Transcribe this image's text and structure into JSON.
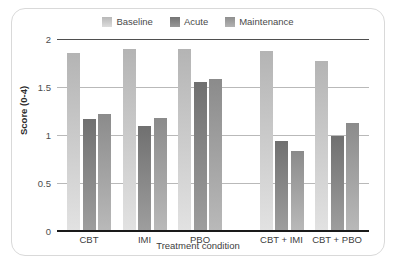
{
  "chart_data": {
    "type": "bar",
    "title": "",
    "xlabel": "Treatment condition",
    "ylabel": "Score (0-4)",
    "ylim": [
      0,
      2
    ],
    "yticks": [
      "0",
      "0.5",
      "1",
      "1.5",
      "2"
    ],
    "ytick_values": [
      0,
      0.5,
      1,
      1.5,
      2
    ],
    "grid": true,
    "legend_position": "top-center",
    "categories": [
      "CBT",
      "IMI",
      "PBO",
      "CBT + IMI",
      "CBT + PBO"
    ],
    "series": [
      {
        "name": "Baseline",
        "color": "#d2d2d2",
        "values": [
          1.85,
          1.9,
          1.9,
          1.88,
          1.77
        ]
      },
      {
        "name": "Acute",
        "color": "#8e8e8e",
        "values": [
          1.17,
          1.09,
          1.55,
          0.94,
          0.99
        ]
      },
      {
        "name": "Maintenance",
        "color": "#a9a9a9",
        "values": [
          1.22,
          1.18,
          1.58,
          0.83,
          1.13
        ]
      }
    ]
  },
  "legend": {
    "entries": [
      {
        "label": "Baseline"
      },
      {
        "label": "Acute"
      },
      {
        "label": "Maintenance"
      }
    ]
  }
}
